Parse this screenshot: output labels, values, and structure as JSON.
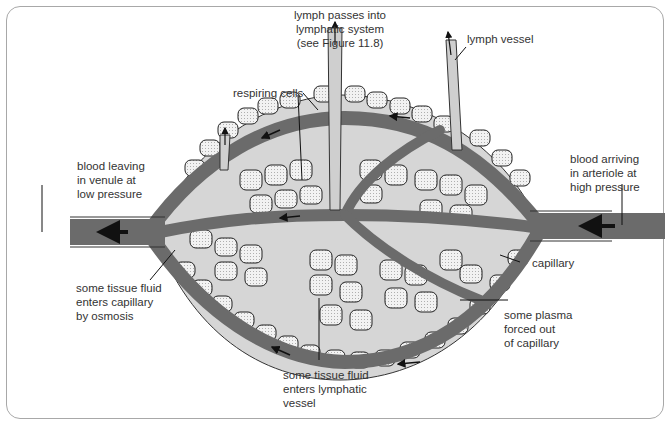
{
  "figure": {
    "colors": {
      "blood_vessel": "#6b6b6b",
      "lymph_vessel": "#cfcfcf",
      "tissue_fluid": "#d4d4d4",
      "cell_fill": "#ececec",
      "frame": "#a8a8a8",
      "text": "#333333"
    }
  },
  "labels": {
    "lymph_system": "lymph passes into\nlymphatic system\n(see Figure 11.8)",
    "respiring_cells": "respiring cells",
    "lymph_vessel": "lymph vessel",
    "blood_arriving": "blood arriving\nin arteriole at\nhigh pressure",
    "blood_leaving": "blood leaving\nin venule at\nlow pressure",
    "capillary": "capillary",
    "tissue_fluid_capillary": "some tissue fluid\nenters capillary\nby osmosis",
    "plasma_forced": "some plasma\nforced out\nof capillary",
    "tissue_fluid_lymph": "some tissue fluid\nenters lymphatic\nvessel"
  }
}
